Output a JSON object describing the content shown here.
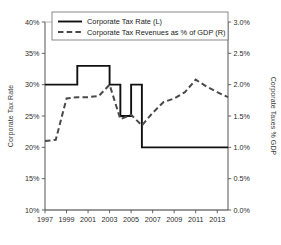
{
  "chart_data": {
    "type": "line",
    "title": "",
    "xlabel": "",
    "x": [
      1997,
      1998,
      1999,
      2000,
      2001,
      2002,
      2003,
      2004,
      2005,
      2006,
      2007,
      2008,
      2009,
      2010,
      2011,
      2012,
      2013,
      2014
    ],
    "xlim": [
      1997,
      2014
    ],
    "xticks": [
      1997,
      1999,
      2001,
      2003,
      2005,
      2007,
      2009,
      2011,
      2013
    ],
    "xtick_labels": [
      "1997",
      "1999",
      "2001",
      "2003",
      "2005",
      "2007",
      "2009",
      "2011",
      "2013"
    ],
    "grid": false,
    "legend_position": "top-center",
    "axes": [
      {
        "id": "left",
        "label": "Corporate Tax Rate",
        "ylim": [
          10,
          40
        ],
        "yticks": [
          10,
          15,
          20,
          25,
          30,
          35,
          40
        ],
        "ytick_labels": [
          "10%",
          "15%",
          "20%",
          "25%",
          "30%",
          "35%",
          "40%"
        ]
      },
      {
        "id": "right",
        "label": "Corporate Taxes % GDP",
        "ylim": [
          0.0,
          3.0
        ],
        "yticks": [
          0.0,
          0.5,
          1.0,
          1.5,
          2.0,
          2.5,
          3.0
        ],
        "ytick_labels": [
          "0.0%",
          "0.5%",
          "1.0%",
          "1.5%",
          "2.0%",
          "2.5%",
          "3.0%"
        ]
      }
    ],
    "series": [
      {
        "name": "Corporate Tax Rate (L)",
        "axis": "left",
        "style": "solid-step",
        "color": "#111111",
        "steps": [
          {
            "from": 1997,
            "to": 2000,
            "value": 30
          },
          {
            "from": 2000,
            "to": 2003,
            "value": 33
          },
          {
            "from": 2003,
            "to": 2004,
            "value": 30
          },
          {
            "from": 2004,
            "to": 2005,
            "value": 25
          },
          {
            "from": 2005,
            "to": 2006,
            "value": 30
          },
          {
            "from": 2006,
            "to": 2014,
            "value": 20
          }
        ],
        "values": [
          30,
          30,
          30,
          33,
          33,
          33,
          30,
          25,
          30,
          20,
          20,
          20,
          20,
          20,
          20,
          20,
          20,
          20
        ]
      },
      {
        "name": "Corporate Tax Revenues as % of GDP (R)",
        "axis": "right",
        "style": "dashed",
        "color": "#4a4a4a",
        "values": [
          1.1,
          1.12,
          1.78,
          1.8,
          1.8,
          1.82,
          2.0,
          1.45,
          1.52,
          1.35,
          1.55,
          1.72,
          1.78,
          1.88,
          2.08,
          1.97,
          1.88,
          1.8
        ]
      }
    ]
  },
  "legend": {
    "items": [
      {
        "label": "Corporate Tax Rate (L)",
        "style": "solid"
      },
      {
        "label": "Corporate Tax Revenues as % of GDP (R)",
        "style": "dashed"
      }
    ]
  }
}
